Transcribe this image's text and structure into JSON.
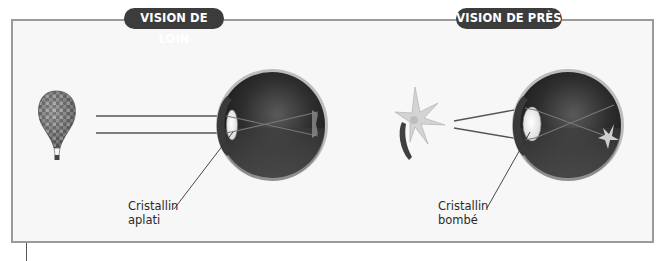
{
  "panels": [
    {
      "title": "VISION DE LOIN",
      "object": "hot-air-balloon",
      "lens_label_line1": "Cristallin",
      "lens_label_line2": "aplati"
    },
    {
      "title": "VISION DE PRÈS",
      "object": "flower",
      "lens_label_line1": "Cristallin",
      "lens_label_line2": "bombé"
    }
  ],
  "colors": {
    "frame_border": "#9a9a9a",
    "pill_background": "#3c3c3c",
    "pill_text": "#ffffff",
    "ray_line": "#555555"
  }
}
